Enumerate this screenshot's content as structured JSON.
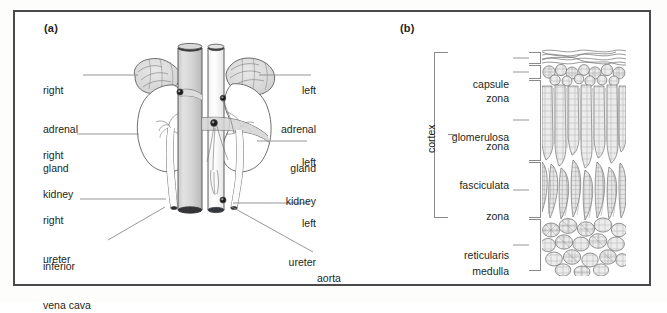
{
  "figure": {
    "type": "anatomy-diagram",
    "background_color": "#ffffff",
    "frame_color": "#4a4a4c",
    "leader_color": "#7d7d80",
    "ink_color": "#231f20"
  },
  "panels": [
    {
      "id": "a",
      "letter": "(a)",
      "title": "gross anatomy of kidneys, adrenal glands and great vessels",
      "labels_left": [
        {
          "name": "right-adrenal-gland",
          "lines": [
            "right",
            "adrenal",
            "gland"
          ]
        },
        {
          "name": "right-kidney",
          "lines": [
            "right",
            "kidney"
          ]
        },
        {
          "name": "right-ureter",
          "lines": [
            "right",
            "ureter"
          ]
        },
        {
          "name": "inferior-vena-cava",
          "lines": [
            "inferior",
            "vena cava"
          ]
        }
      ],
      "labels_right": [
        {
          "name": "left-adrenal-gland",
          "lines": [
            "left",
            "adrenal",
            "gland"
          ]
        },
        {
          "name": "left-kidney",
          "lines": [
            "left",
            "kidney"
          ]
        },
        {
          "name": "left-ureter",
          "lines": [
            "left",
            "ureter"
          ]
        },
        {
          "name": "aorta",
          "lines": [
            "aorta"
          ]
        }
      ]
    },
    {
      "id": "b",
      "letter": "(b)",
      "title": "histological layers of the adrenal gland",
      "group_label": "cortex",
      "layers": [
        {
          "name": "capsule",
          "lines": [
            "capsule"
          ]
        },
        {
          "name": "zona-glomerulosa",
          "lines": [
            "zona",
            "glomerulosa"
          ]
        },
        {
          "name": "zona-fasciculata",
          "lines": [
            "zona",
            "fasciculata"
          ]
        },
        {
          "name": "zona-reticularis",
          "lines": [
            "zona",
            "reticularis"
          ]
        },
        {
          "name": "medulla",
          "lines": [
            "medulla"
          ]
        }
      ]
    }
  ]
}
